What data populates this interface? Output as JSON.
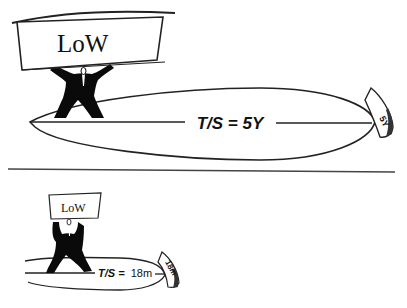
{
  "top_panel": {
    "sign_label": "LoW",
    "formula_label": "T/S = 5Y",
    "tip_label": "5Y"
  },
  "bottom_panel": {
    "sign_label": "LoW",
    "formula_prefix": "T/S =",
    "formula_value": "18m",
    "tip_label": "18m"
  }
}
